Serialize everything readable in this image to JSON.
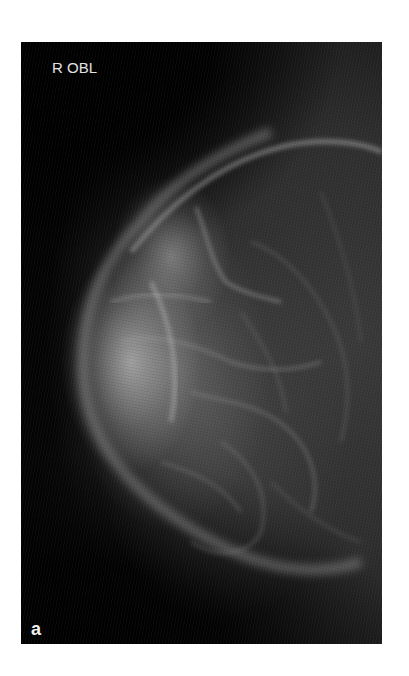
{
  "figure": {
    "view_label": "R OBL",
    "panel_label": "a",
    "image_description": "Right mediolateral oblique mammogram",
    "colors": {
      "background": "#030303",
      "label_text": "#e2e2e2",
      "page": "#ffffff"
    }
  }
}
